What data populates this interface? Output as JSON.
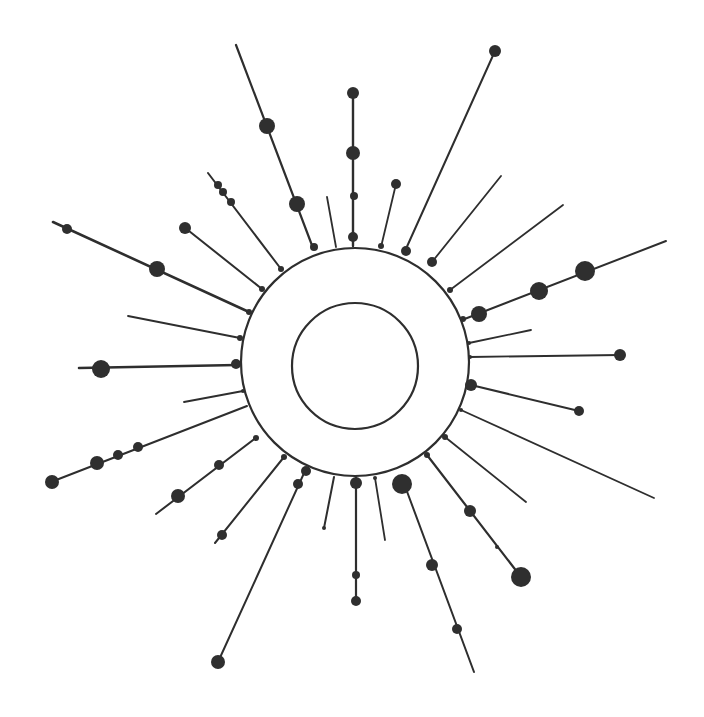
{
  "diagram": {
    "type": "radial-burst",
    "background": "#ffffff",
    "ink": "#2e2e2e",
    "outer_ring": {
      "cx": 355,
      "cy": 362,
      "r": 114,
      "stroke_width": 2.2
    },
    "inner_ring": {
      "cx": 355,
      "cy": 366,
      "r": 63,
      "stroke_width": 2.2
    },
    "rays": [
      {
        "x1": 313,
        "y1": 248,
        "x2": 236,
        "y2": 45,
        "w": 2.2,
        "nodes": [
          [
            267,
            126,
            8
          ],
          [
            297,
            204,
            8
          ],
          [
            314,
            247,
            4
          ]
        ]
      },
      {
        "x1": 336,
        "y1": 247,
        "x2": 327,
        "y2": 197,
        "w": 1.8,
        "nodes": []
      },
      {
        "x1": 353,
        "y1": 246,
        "x2": 353,
        "y2": 93,
        "w": 2.4,
        "nodes": [
          [
            353,
            93,
            6
          ],
          [
            353,
            153,
            7
          ],
          [
            354,
            196,
            4
          ],
          [
            353,
            237,
            5
          ]
        ]
      },
      {
        "x1": 381,
        "y1": 247,
        "x2": 396,
        "y2": 184,
        "w": 1.8,
        "nodes": [
          [
            396,
            184,
            5
          ],
          [
            381,
            246,
            3
          ]
        ]
      },
      {
        "x1": 405,
        "y1": 251,
        "x2": 495,
        "y2": 51,
        "w": 2.0,
        "nodes": [
          [
            495,
            51,
            6
          ],
          [
            406,
            251,
            5
          ]
        ]
      },
      {
        "x1": 432,
        "y1": 262,
        "x2": 501,
        "y2": 176,
        "w": 1.8,
        "nodes": [
          [
            432,
            262,
            5
          ]
        ]
      },
      {
        "x1": 450,
        "y1": 290,
        "x2": 563,
        "y2": 205,
        "w": 1.8,
        "nodes": [
          [
            450,
            290,
            3
          ]
        ]
      },
      {
        "x1": 462,
        "y1": 320,
        "x2": 666,
        "y2": 241,
        "w": 2.0,
        "nodes": [
          [
            585,
            271,
            10
          ],
          [
            539,
            291,
            9
          ],
          [
            479,
            314,
            8
          ],
          [
            463,
            319,
            3
          ]
        ]
      },
      {
        "x1": 469,
        "y1": 343,
        "x2": 531,
        "y2": 330,
        "w": 1.8,
        "nodes": [
          [
            469,
            343,
            2
          ]
        ]
      },
      {
        "x1": 470,
        "y1": 357,
        "x2": 620,
        "y2": 355,
        "w": 1.8,
        "nodes": [
          [
            620,
            355,
            6
          ],
          [
            470,
            357,
            2
          ]
        ]
      },
      {
        "x1": 471,
        "y1": 385,
        "x2": 579,
        "y2": 411,
        "w": 2.0,
        "nodes": [
          [
            471,
            385,
            6
          ],
          [
            579,
            411,
            5
          ]
        ]
      },
      {
        "x1": 461,
        "y1": 410,
        "x2": 654,
        "y2": 498,
        "w": 1.8,
        "nodes": [
          [
            461,
            410,
            2
          ]
        ]
      },
      {
        "x1": 445,
        "y1": 437,
        "x2": 526,
        "y2": 502,
        "w": 1.8,
        "nodes": [
          [
            445,
            437,
            3
          ]
        ]
      },
      {
        "x1": 427,
        "y1": 455,
        "x2": 521,
        "y2": 577,
        "w": 2.2,
        "nodes": [
          [
            427,
            455,
            3
          ],
          [
            470,
            511,
            6
          ],
          [
            497,
            547,
            2
          ],
          [
            521,
            577,
            10
          ]
        ]
      },
      {
        "x1": 402,
        "y1": 478,
        "x2": 474,
        "y2": 672,
        "w": 2.0,
        "nodes": [
          [
            402,
            484,
            10
          ],
          [
            432,
            565,
            6
          ],
          [
            457,
            629,
            5
          ]
        ]
      },
      {
        "x1": 375,
        "y1": 478,
        "x2": 385,
        "y2": 540,
        "w": 1.8,
        "nodes": [
          [
            375,
            478,
            2
          ]
        ]
      },
      {
        "x1": 356,
        "y1": 477,
        "x2": 356,
        "y2": 601,
        "w": 2.2,
        "nodes": [
          [
            356,
            483,
            6
          ],
          [
            356,
            575,
            4
          ],
          [
            356,
            601,
            5
          ]
        ]
      },
      {
        "x1": 334,
        "y1": 477,
        "x2": 324,
        "y2": 528,
        "w": 2.0,
        "nodes": [
          [
            324,
            528,
            2
          ]
        ]
      },
      {
        "x1": 305,
        "y1": 471,
        "x2": 218,
        "y2": 662,
        "w": 2.0,
        "nodes": [
          [
            306,
            471,
            5
          ],
          [
            298,
            484,
            5
          ],
          [
            218,
            662,
            7
          ]
        ]
      },
      {
        "x1": 284,
        "y1": 457,
        "x2": 215,
        "y2": 543,
        "w": 2.0,
        "nodes": [
          [
            284,
            457,
            3
          ],
          [
            222,
            535,
            5
          ]
        ]
      },
      {
        "x1": 257,
        "y1": 437,
        "x2": 156,
        "y2": 514,
        "w": 2.0,
        "nodes": [
          [
            178,
            496,
            7
          ],
          [
            219,
            465,
            5
          ],
          [
            256,
            438,
            3
          ]
        ]
      },
      {
        "x1": 247,
        "y1": 406,
        "x2": 51,
        "y2": 482,
        "w": 2.0,
        "nodes": [
          [
            52,
            482,
            7
          ],
          [
            97,
            463,
            7
          ],
          [
            118,
            455,
            5
          ],
          [
            138,
            447,
            5
          ]
        ]
      },
      {
        "x1": 243,
        "y1": 391,
        "x2": 184,
        "y2": 402,
        "w": 1.8,
        "nodes": [
          [
            243,
            391,
            2
          ]
        ]
      },
      {
        "x1": 237,
        "y1": 365,
        "x2": 79,
        "y2": 368,
        "w": 2.6,
        "nodes": [
          [
            101,
            369,
            9
          ],
          [
            236,
            364,
            5
          ]
        ]
      },
      {
        "x1": 240,
        "y1": 338,
        "x2": 128,
        "y2": 316,
        "w": 1.8,
        "nodes": [
          [
            240,
            338,
            3
          ]
        ]
      },
      {
        "x1": 249,
        "y1": 312,
        "x2": 53,
        "y2": 222,
        "w": 2.6,
        "nodes": [
          [
            67,
            229,
            5
          ],
          [
            157,
            269,
            8
          ],
          [
            249,
            312,
            3
          ]
        ]
      },
      {
        "x1": 262,
        "y1": 289,
        "x2": 184,
        "y2": 227,
        "w": 2.0,
        "nodes": [
          [
            185,
            228,
            6
          ],
          [
            262,
            289,
            3
          ]
        ]
      },
      {
        "x1": 281,
        "y1": 269,
        "x2": 208,
        "y2": 173,
        "w": 2.0,
        "nodes": [
          [
            218,
            185,
            4
          ],
          [
            223,
            192,
            4
          ],
          [
            231,
            202,
            4
          ],
          [
            281,
            269,
            3
          ]
        ]
      }
    ]
  }
}
